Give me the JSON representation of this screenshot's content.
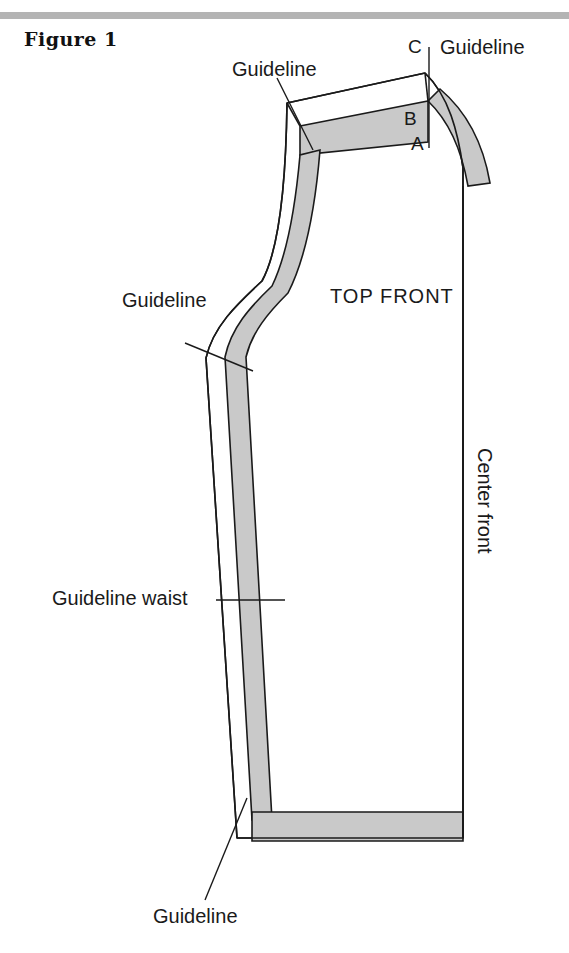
{
  "figure": {
    "caption": "Figure 1"
  },
  "diagram": {
    "type": "sewing-pattern",
    "piece_label": "TOP FRONT",
    "colors": {
      "seam_allowance_fill": "#c9c9c9",
      "outline": "#1a1a1a",
      "paper": "#ffffff",
      "rule": "#b4b4b4",
      "text": "#1a1a1a"
    },
    "labels": {
      "guideline_shoulder": "Guideline",
      "guideline_neck": "Guideline",
      "guideline_armhole": "Guideline",
      "guideline_waist": "Guideline waist",
      "guideline_hem": "Guideline",
      "point_a": "A",
      "point_b": "B",
      "point_c": "C",
      "center_front": "Center front",
      "top_front": "TOP FRONT"
    }
  }
}
